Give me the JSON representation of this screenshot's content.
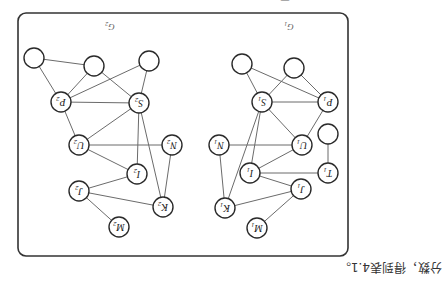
{
  "page": {
    "orientation": "rotated-180",
    "caption_partial": "图 4.x",
    "body_text": "分数，得到表4.1。"
  },
  "figure": {
    "graphs": [
      {
        "id": "G1",
        "label": "G",
        "subscript": "1",
        "nodes": [
          {
            "id": "c1a",
            "label": "",
            "sub": "",
            "x": 242,
            "y": 64
          },
          {
            "id": "c1b",
            "label": "",
            "sub": "",
            "x": 294,
            "y": 68
          },
          {
            "id": "S1",
            "label": "S",
            "sub": "1",
            "x": 262,
            "y": 102
          },
          {
            "id": "P1",
            "label": "P",
            "sub": "1",
            "x": 328,
            "y": 102
          },
          {
            "id": "c1c",
            "label": "",
            "sub": "",
            "x": 328,
            "y": 134
          },
          {
            "id": "N1",
            "label": "N",
            "sub": "1",
            "x": 219,
            "y": 145
          },
          {
            "id": "U1",
            "label": "U",
            "sub": "1",
            "x": 302,
            "y": 145
          },
          {
            "id": "I1",
            "label": "I",
            "sub": "1",
            "x": 250,
            "y": 173
          },
          {
            "id": "T1",
            "label": "T",
            "sub": "1",
            "x": 328,
            "y": 173
          },
          {
            "id": "J1",
            "label": "J",
            "sub": "1",
            "x": 301,
            "y": 189
          },
          {
            "id": "K1",
            "label": "K",
            "sub": "1",
            "x": 225,
            "y": 208
          },
          {
            "id": "M1",
            "label": "M",
            "sub": "1",
            "x": 257,
            "y": 228
          }
        ],
        "edges": [
          [
            "c1a",
            "S1"
          ],
          [
            "c1a",
            "P1"
          ],
          [
            "c1b",
            "S1"
          ],
          [
            "c1b",
            "P1"
          ],
          [
            "S1",
            "P1"
          ],
          [
            "S1",
            "U1"
          ],
          [
            "S1",
            "I1"
          ],
          [
            "S1",
            "K1"
          ],
          [
            "P1",
            "U1"
          ],
          [
            "U1",
            "N1"
          ],
          [
            "U1",
            "I1"
          ],
          [
            "c1c",
            "T1"
          ],
          [
            "I1",
            "T1"
          ],
          [
            "I1",
            "J1"
          ],
          [
            "N1",
            "K1"
          ],
          [
            "K1",
            "J1"
          ],
          [
            "J1",
            "M1"
          ]
        ]
      },
      {
        "id": "G2",
        "label": "G",
        "subscript": "2",
        "nodes": [
          {
            "id": "c2a",
            "label": "",
            "sub": "",
            "x": 34,
            "y": 58
          },
          {
            "id": "c2b",
            "label": "",
            "sub": "",
            "x": 94,
            "y": 66
          },
          {
            "id": "c2c",
            "label": "",
            "sub": "",
            "x": 149,
            "y": 61
          },
          {
            "id": "P2",
            "label": "P",
            "sub": "2",
            "x": 61,
            "y": 102
          },
          {
            "id": "S2",
            "label": "S",
            "sub": "2",
            "x": 139,
            "y": 103
          },
          {
            "id": "U2",
            "label": "U",
            "sub": "2",
            "x": 79,
            "y": 145
          },
          {
            "id": "N2",
            "label": "N",
            "sub": "2",
            "x": 172,
            "y": 145
          },
          {
            "id": "I2",
            "label": "I",
            "sub": "2",
            "x": 137,
            "y": 174
          },
          {
            "id": "J2",
            "label": "J",
            "sub": "2",
            "x": 79,
            "y": 191
          },
          {
            "id": "K2",
            "label": "K",
            "sub": "2",
            "x": 163,
            "y": 207
          },
          {
            "id": "M2",
            "label": "M",
            "sub": "2",
            "x": 119,
            "y": 227
          }
        ],
        "edges": [
          [
            "c2a",
            "P2"
          ],
          [
            "c2a",
            "c2b"
          ],
          [
            "c2b",
            "P2"
          ],
          [
            "c2b",
            "S2"
          ],
          [
            "c2c",
            "P2"
          ],
          [
            "c2c",
            "S2"
          ],
          [
            "P2",
            "S2"
          ],
          [
            "P2",
            "U2"
          ],
          [
            "S2",
            "U2"
          ],
          [
            "S2",
            "I2"
          ],
          [
            "S2",
            "K2"
          ],
          [
            "U2",
            "N2"
          ],
          [
            "U2",
            "I2"
          ],
          [
            "N2",
            "K2"
          ],
          [
            "I2",
            "J2"
          ],
          [
            "J2",
            "K2"
          ],
          [
            "J2",
            "M2"
          ]
        ]
      }
    ],
    "graph_labels": [
      {
        "text": "G",
        "sub": "2",
        "x": 110,
        "y": 27
      },
      {
        "text": "G",
        "sub": "1",
        "x": 289,
        "y": 27
      }
    ],
    "frame": {
      "x": 18,
      "y": 13,
      "width": 330,
      "height": 243,
      "radius": 8
    },
    "node_radius": 10,
    "colors": {
      "edge": "#6b6b6b",
      "node_stroke": "#2a2a2a",
      "frame": "#333333",
      "background": "#ffffff"
    }
  }
}
